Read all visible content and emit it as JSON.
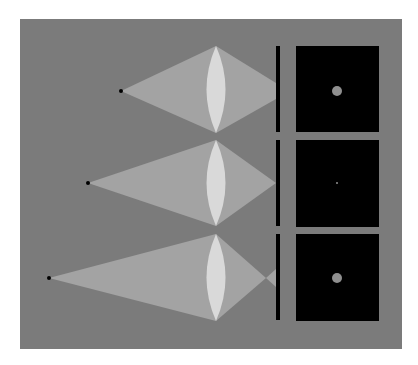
{
  "diagram": {
    "colors": {
      "background": "#ffffff",
      "panel": "#7b7b7b",
      "light_cone": "#a3a3a3",
      "lens": "#d9d9d9",
      "source_point": "#000000",
      "screen_bar": "#000000",
      "image_box": "#000000",
      "image_spot": "#8f8f8f"
    },
    "rows": [
      {
        "name": "source-far",
        "focus": "behind-screen",
        "spot_size": "blur-disc"
      },
      {
        "name": "source-middle",
        "focus": "on-screen",
        "spot_size": "point"
      },
      {
        "name": "source-near",
        "focus": "in-front-of-screen",
        "spot_size": "blur-disc"
      }
    ]
  }
}
